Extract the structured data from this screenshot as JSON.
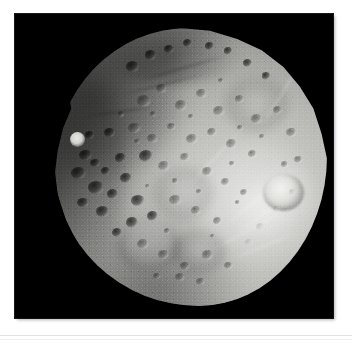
{
  "page": {
    "background_color": "#ffffff",
    "rule_color": "#e3e3e3"
  },
  "figure": {
    "name": "phobos-photograph",
    "plate_background": "#000000",
    "frame": {
      "x": 15,
      "y": 14,
      "width": 318,
      "height": 304
    },
    "subject": {
      "label": "Phobos",
      "body_type": "moon",
      "shape": "irregular oblate potato",
      "surface": "heavily cratered gray regolith",
      "illumination": "lit from lower right, terminator along upper-left limb",
      "colors": {
        "space": "#000000",
        "regolith_bright": "#d9d9d6",
        "regolith_mid": "#9d9d9a",
        "regolith_shadow": "#3d3d3c",
        "limb_dark": "#0a0a0a",
        "crater_highlight": "#f2f2f0"
      }
    },
    "features": [
      {
        "name": "bright-ejecta-crater-right-limb",
        "position": "right limb, mid-height",
        "brightness": "brightest feature"
      },
      {
        "name": "bright-small-crater-left-limb",
        "position": "far left, upper-middle",
        "brightness": "bright point"
      },
      {
        "name": "shadowed-terminator-ridge",
        "position": "upper-left limb",
        "brightness": "deep shadow"
      },
      {
        "name": "large-basin-lower-left",
        "position": "lower left quadrant",
        "brightness": "soft rimmed depression"
      },
      {
        "name": "large-basin-lower-center",
        "position": "lower center",
        "brightness": "soft rimmed depression"
      },
      {
        "name": "groove-striations",
        "position": "right and lower-right flank",
        "brightness": "bright linear streaks"
      }
    ]
  },
  "caption": {
    "visible": false,
    "text": ""
  }
}
